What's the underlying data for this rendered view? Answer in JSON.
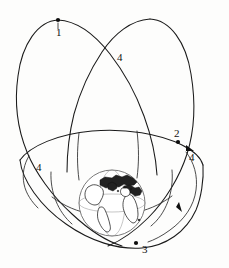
{
  "figure": {
    "background_color": "#fdfdfc",
    "line_color": "#1a1a1a",
    "globe_outline_color": "#6b6b6b"
  },
  "globe": {
    "name": "earth",
    "center_x": 112,
    "center_y": 203,
    "radius": 33
  },
  "markers": [
    {
      "id": "1",
      "label": "1",
      "dot_x": 58,
      "dot_y": 20,
      "label_x": 57,
      "label_y": 23
    },
    {
      "id": "4a",
      "label": "4",
      "dot_x": null,
      "dot_y": null,
      "label_x": 117,
      "label_y": 57
    },
    {
      "id": "2",
      "label": "2",
      "dot_x": 178,
      "dot_y": 142,
      "label_x": 174,
      "label_y": 130
    },
    {
      "id": "4b",
      "label": "4",
      "dot_x": null,
      "dot_y": null,
      "label_x": 189,
      "label_y": 157
    },
    {
      "id": "4c",
      "label": "4",
      "dot_x": null,
      "dot_y": null,
      "label_x": 36,
      "label_y": 167
    },
    {
      "id": "3",
      "label": "3",
      "dot_x": 136,
      "dot_y": 243,
      "label_x": 142,
      "label_y": 246
    }
  ],
  "arrows": [
    {
      "name": "direction-arrow-upper-right",
      "x": 190,
      "y": 147,
      "angle": 35
    },
    {
      "name": "direction-arrow-lower-right",
      "x": 180,
      "y": 208,
      "angle": -68
    }
  ],
  "orbits": [
    {
      "name": "left-loop-orbit",
      "description": "large elongated loop rising from lower-left over the top-left apex"
    },
    {
      "name": "right-loop-orbit",
      "description": "large elongated loop rising from lower-right over the top-right apex"
    },
    {
      "name": "equatorial-ellipse",
      "description": "wide shallow ellipse through the equatorial plane"
    },
    {
      "name": "inner-orbit",
      "description": "inner orbit passing close to Earth"
    }
  ]
}
